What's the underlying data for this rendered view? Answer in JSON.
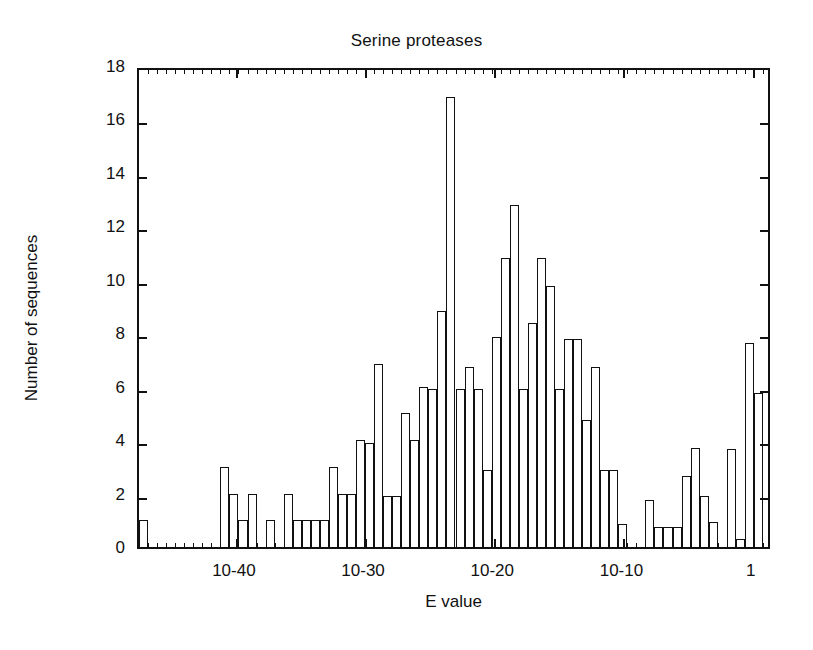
{
  "chart_data": {
    "type": "bar",
    "title": "Serine proteases",
    "xlabel": "E value",
    "ylabel": "Number of sequences",
    "ylim": [
      0,
      18
    ],
    "ytick_values": [
      0,
      2,
      4,
      6,
      8,
      10,
      12,
      14,
      16,
      18
    ],
    "ytick_labels": [
      "0",
      "2",
      "4",
      "6",
      "8",
      "10",
      "12",
      "14",
      "16",
      "18"
    ],
    "xtick_labels": [
      "10-40",
      "10-30",
      "10-20",
      "10-10",
      "1"
    ],
    "xtick_exponents": [
      -40,
      -30,
      -20,
      -10,
      0
    ],
    "xlim_exponents": [
      -47.5,
      1.5
    ],
    "grid": false,
    "legend": null,
    "bin_width_exponents": 0.7,
    "note": "Histogram of HMM search E values; x axis is log10(E value) running from about 1e-47 on the left to about 10 on the right. Each bar is one bin of the log scale.",
    "bar_left_exponents": [
      -47.5,
      -46.8,
      -46.1,
      -45.4,
      -44.7,
      -44.0,
      -43.3,
      -42.6,
      -41.9,
      -41.2,
      -40.5,
      -39.8,
      -39.1,
      -38.4,
      -37.7,
      -37.0,
      -36.3,
      -35.6,
      -34.9,
      -34.2,
      -33.5,
      -32.8,
      -32.1,
      -31.4,
      -30.7,
      -30.0,
      -29.3,
      -28.6,
      -27.9,
      -27.2,
      -26.5,
      -25.8,
      -25.1,
      -24.4,
      -23.7,
      -23.0,
      -22.3,
      -21.6,
      -20.9,
      -20.2,
      -19.5,
      -18.8,
      -18.1,
      -17.4,
      -16.7,
      -16.0,
      -15.3,
      -14.6,
      -13.9,
      -13.2,
      -12.5,
      -11.8,
      -11.1,
      -10.4,
      -9.7,
      -9.0,
      -8.3,
      -7.6,
      -6.9,
      -6.2,
      -5.5,
      -4.8,
      -4.1,
      -3.4,
      -2.7,
      -2.0,
      -1.3,
      -0.6,
      0.1,
      0.8
    ],
    "values": [
      1,
      0,
      0,
      0,
      0,
      0,
      0,
      0,
      0,
      3,
      2,
      1,
      2,
      0,
      1,
      0,
      2,
      1,
      1,
      1,
      1,
      3,
      2,
      2,
      4,
      3.9,
      6.85,
      1.9,
      1.9,
      5,
      4,
      6,
      5.9,
      8.85,
      16.85,
      5.9,
      6.75,
      5.9,
      2.9,
      7.85,
      10.8,
      12.8,
      5.9,
      8.4,
      10.8,
      9.75,
      5.9,
      7.8,
      7.8,
      4.75,
      6.75,
      2.9,
      2.9,
      0.85,
      0,
      0,
      1.75,
      0.75,
      0.75,
      0.75,
      2.65,
      3.7,
      1.9,
      0.95,
      0,
      3.65,
      0.3,
      7.65,
      5.75,
      0
    ],
    "peak": {
      "value": 17,
      "approx_exponent": -24
    },
    "secondary_peak": {
      "value": 13,
      "approx_exponent": -19
    }
  },
  "axes": {
    "y_title": "Number of sequences",
    "x_title": "E value"
  }
}
